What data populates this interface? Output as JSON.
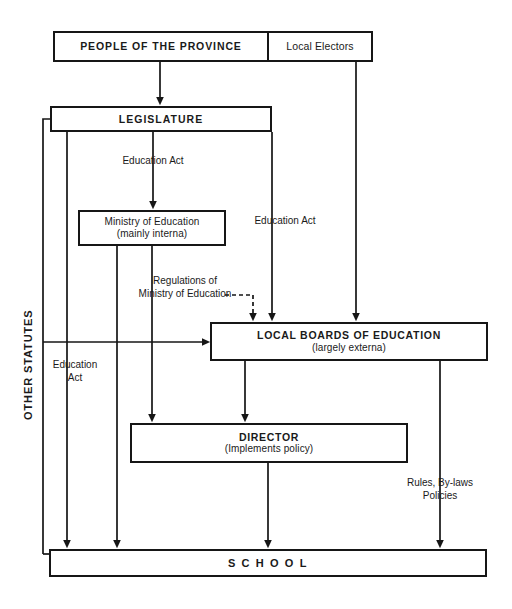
{
  "diagram": {
    "boxes": {
      "people": {
        "label": "PEOPLE OF THE PROVINCE"
      },
      "electors": {
        "label": "Local Electors"
      },
      "legislature": {
        "label": "LEGISLATURE"
      },
      "ministry": {
        "line1": "Ministry of Education",
        "line2": "(mainly interna)"
      },
      "local_boards": {
        "line1": "LOCAL BOARDS OF EDUCATION",
        "line2": "(largely externa)"
      },
      "director": {
        "line1": "DIRECTOR",
        "line2": "(Implements policy)"
      },
      "school": {
        "label": "S C H O O L"
      }
    },
    "edge_labels": {
      "other_statutes": "OTHER STATUTES",
      "education_act_ministry": "Education Act",
      "education_act_boards": "Education Act",
      "education_act_school": "Education\nAct",
      "regulations": "Regulations of\nMinistry of Education",
      "rules_bylaws": "Rules, By-laws\nPolicies"
    },
    "colors": {
      "line": "#161616",
      "text": "#1a1a1a",
      "background": "#ffffff"
    }
  }
}
